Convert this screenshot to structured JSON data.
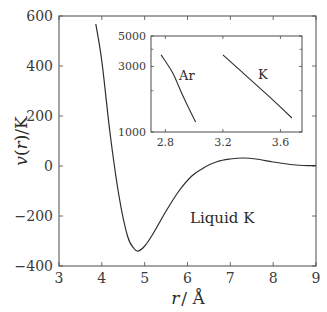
{
  "chart_data": [
    {
      "type": "line",
      "title": "",
      "xlabel": "r / Å",
      "ylabel": "v(r) / K",
      "xlim": [
        3,
        9
      ],
      "ylim": [
        -400,
        600
      ],
      "xticks": [
        "3",
        "4",
        "5",
        "6",
        "7",
        "8",
        "9"
      ],
      "yticks": [
        "-400",
        "-200",
        "0",
        "200",
        "400",
        "600"
      ],
      "grid": false,
      "annotations": [
        "Liquid K"
      ],
      "series": [
        {
          "name": "Liquid K",
          "x": [
            3.86,
            4.0,
            4.2,
            4.4,
            4.6,
            4.75,
            4.85,
            5.0,
            5.2,
            5.5,
            5.8,
            6.1,
            6.4,
            6.7,
            7.0,
            7.3,
            7.6,
            8.0,
            8.4,
            8.7,
            9.0
          ],
          "y": [
            568,
            420,
            120,
            -120,
            -280,
            -330,
            -340,
            -320,
            -270,
            -180,
            -100,
            -40,
            -5,
            18,
            28,
            32,
            28,
            16,
            6,
            2,
            2
          ]
        }
      ]
    },
    {
      "type": "line",
      "title": "",
      "xlabel": "",
      "ylabel": "",
      "yscale": "log",
      "xlim": [
        2.7,
        3.75
      ],
      "ylim": [
        1000,
        5000
      ],
      "xticks": [
        "2.8",
        "3.2",
        "3.6"
      ],
      "yticks": [
        "1000",
        "3000",
        "5000"
      ],
      "grid": false,
      "legend": [],
      "annotations": [
        "Ar",
        "K"
      ],
      "series": [
        {
          "name": "Ar",
          "x": [
            2.77,
            2.85,
            2.92,
            3.01
          ],
          "y": [
            3640,
            2700,
            1850,
            1180
          ]
        },
        {
          "name": "K",
          "x": [
            3.2,
            3.33,
            3.5,
            3.68
          ],
          "y": [
            3640,
            2750,
            1900,
            1265
          ]
        }
      ]
    }
  ],
  "labels": {
    "ylabel_v": "v",
    "ylabel_paren": "(",
    "ylabel_r": "r",
    "ylabel_rest": ")/K",
    "xlabel_r": "r",
    "xlabel_rest": "/ Å",
    "annotation_main": "Liquid K",
    "annotation_ar": "Ar",
    "annotation_k": "K"
  }
}
